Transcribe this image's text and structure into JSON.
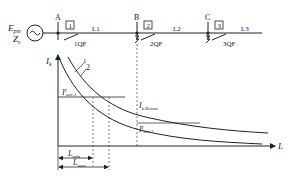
{
  "source": {
    "emf_label": "E",
    "emf_sub": "pm",
    "imp_label": "Z",
    "imp_sub": "s",
    "symbol": "ac-source-icon"
  },
  "buses": [
    {
      "name": "A",
      "relay": "1",
      "breaker": "1QF",
      "line": "L1"
    },
    {
      "name": "B",
      "relay": "2",
      "breaker": "2QF",
      "line": "L2"
    },
    {
      "name": "C",
      "relay": "3",
      "breaker": "3QF",
      "line": "L3"
    }
  ],
  "graph": {
    "y_axis_label": "I",
    "y_axis_sub": "k",
    "x_axis_label": "L",
    "curve1_label": "1",
    "curve2_label": "2",
    "iact1_label": "I",
    "iact1_sup": "I",
    "iact1_sub": "act.1",
    "ikbmax_label": "I",
    "ikbmax_sub": "k.B.max",
    "iact2_label": "I",
    "iact2_sup": "I",
    "iact2_sub": "act.2",
    "lmin_label": "L",
    "lmin_sub": "min",
    "lmax_label": "L",
    "lmax_sub": "max"
  }
}
